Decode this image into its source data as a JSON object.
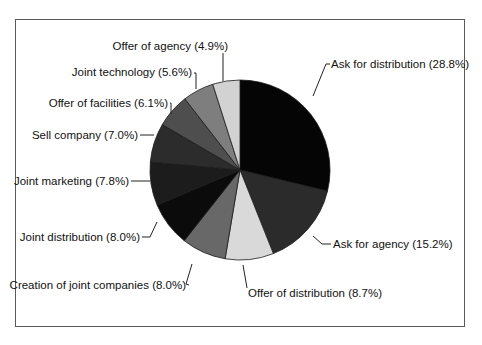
{
  "chart_data": {
    "type": "pie",
    "title": "",
    "start_angle_deg": 0,
    "direction": "clockwise",
    "slices": [
      {
        "label": "Ask for distribution",
        "value": 28.8,
        "display": "Ask for distribution (28.8%)",
        "color": "#050505"
      },
      {
        "label": "Ask for agency",
        "value": 15.2,
        "display": "Ask for agency (15.2%)",
        "color": "#2b2b2b"
      },
      {
        "label": "Offer of distribution",
        "value": 8.7,
        "display": "Offer of distribution (8.7%)",
        "color": "#d9d9d9"
      },
      {
        "label": "Creation of joint companies",
        "value": 8.0,
        "display": "Creation of joint companies (8.0%)",
        "color": "#686868"
      },
      {
        "label": "Joint distribution",
        "value": 8.0,
        "display": "Joint distribution (8.0%)",
        "color": "#0b0b0b"
      },
      {
        "label": "Joint marketing",
        "value": 7.8,
        "display": "Joint marketing (7.8%)",
        "color": "#1c1c1c"
      },
      {
        "label": "Sell company",
        "value": 7.0,
        "display": "Sell company (7.0%)",
        "color": "#2c2c2c"
      },
      {
        "label": "Offer of facilities",
        "value": 6.1,
        "display": "Offer of facilities (6.1%)",
        "color": "#4e4e4e"
      },
      {
        "label": "Joint technology",
        "value": 5.6,
        "display": "Joint technology (5.6%)",
        "color": "#7e7e7e"
      },
      {
        "label": "Offer of agency",
        "value": 4.9,
        "display": "Offer of agency (4.9%)",
        "color": "#d2d2d2"
      }
    ]
  },
  "layout": {
    "cx": 240,
    "cy": 170,
    "r": 90,
    "labels": [
      {
        "x": 331,
        "y": 68,
        "anchor": "start",
        "path": "M313,96 L326,64 L330,64"
      },
      {
        "x": 333,
        "y": 248,
        "anchor": "start",
        "path": "M313,236 L322,244 L331,244"
      },
      {
        "x": 248,
        "y": 297,
        "anchor": "start",
        "path": "M243,265 L247,288"
      },
      {
        "x": 186,
        "y": 289,
        "anchor": "end",
        "path": "M192,264 L186,284 L189,285"
      },
      {
        "x": 140,
        "y": 241,
        "anchor": "end",
        "path": "M157,222 L150,237 L142,237"
      },
      {
        "x": 129,
        "y": 185,
        "anchor": "end",
        "path": "M150,181 L131,181"
      },
      {
        "x": 138,
        "y": 139,
        "anchor": "end",
        "path": "M154,135 L140,135"
      },
      {
        "x": 168,
        "y": 107,
        "anchor": "end",
        "path": "M171,114 L171,103 L170,103"
      },
      {
        "x": 192,
        "y": 76,
        "anchor": "end",
        "path": "M196,89 L196,73 L194,73"
      },
      {
        "x": 228,
        "y": 50,
        "anchor": "end",
        "path": "M223,81 L223,53"
      }
    ]
  }
}
